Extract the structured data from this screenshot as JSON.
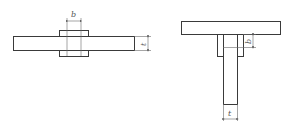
{
  "figures": [
    {
      "id": "left",
      "description": "Butt joint of plate with double cover plates",
      "labels": {
        "width": "b",
        "thickness": "t"
      }
    },
    {
      "id": "right",
      "description": "T-joint with web plate and double side plates",
      "labels": {
        "width": "b",
        "thickness": "t"
      }
    }
  ],
  "colors": {
    "line": "#3a3a3a",
    "dimension": "#6a6a6a",
    "background": "#ffffff"
  }
}
